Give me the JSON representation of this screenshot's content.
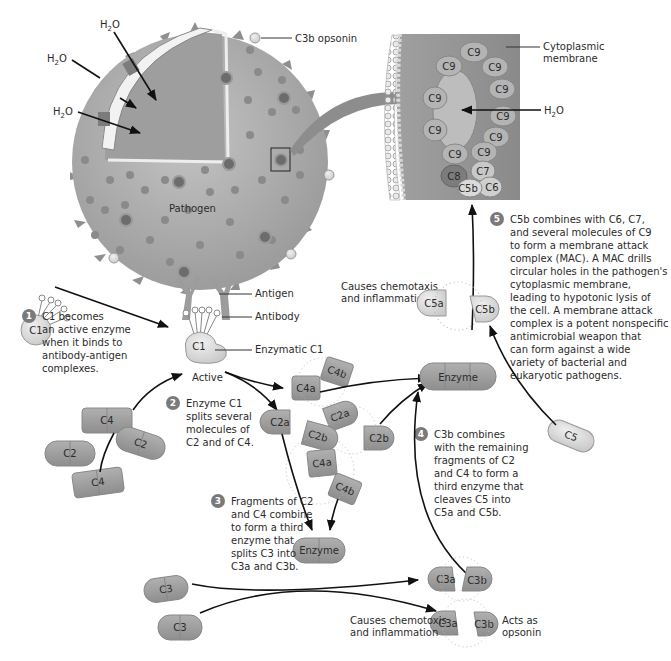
{
  "colors": {
    "pathogen": "#a9a9a9",
    "pathogen_dark": "#8a8a8a",
    "molecule_dark": "#9a9a9a",
    "molecule_light": "#d8d8d8",
    "badge": "#7a7a7a",
    "arrow": "#111111",
    "membrane": "#8f8f8f"
  },
  "pathogen": {
    "label": "Pathogen",
    "water_labels": [
      "H2O",
      "H2O",
      "H2O"
    ],
    "c3b_opsonin": "C3b opsonin",
    "antigen": "Antigen",
    "antibody": "Antibody",
    "enzymatic_c1": "Enzymatic C1",
    "active": "Active"
  },
  "mac_inset": {
    "cytoplasmic_membrane_line1": "Cytoplasmic",
    "cytoplasmic_membrane_line2": "membrane",
    "water": "H2O",
    "molecules": [
      "C9",
      "C9",
      "C9",
      "C9",
      "C9",
      "C9",
      "C9",
      "C9",
      "C9",
      "C9",
      "C8",
      "C7",
      "C6",
      "C5b"
    ]
  },
  "molecules": {
    "c1_inactive": "C1",
    "c1_active": "C1",
    "c4_a": "C4",
    "c4_b": "C4",
    "c2_a": "C2",
    "c2_b": "C2",
    "c4a_1": "C4a",
    "c4b_1": "C4b",
    "c2a_1": "C2a",
    "c2a_2": "C2a",
    "c2b_1": "C2b",
    "c2b_2": "C2b",
    "c4a_2": "C4a",
    "c4b_2": "C4b",
    "enzyme_top": "Enzyme",
    "enzyme_bottom": "Enzyme",
    "c5": "C5",
    "c5a": "C5a",
    "c5b": "C5b",
    "c3_a": "C3",
    "c3_b": "C3",
    "c3a_top": "C3a",
    "c3b_top": "C3b",
    "c3a_bottom": "C3a",
    "c3b_bottom": "C3b"
  },
  "annotations": {
    "c5a_effect_line1": "Causes chemotaxis",
    "c5a_effect_line2": "and inflammation",
    "c3a_effect_line1": "Causes chemotoxis",
    "c3a_effect_line2": "and inflammation",
    "c3b_effect_line1": "Acts as",
    "c3b_effect_line2": "opsonin"
  },
  "steps": [
    {
      "number": "1",
      "lines": [
        "C1 becomes",
        "an active enzyme",
        "when it binds to",
        "antibody-antigen",
        "complexes."
      ]
    },
    {
      "number": "2",
      "lines": [
        "Enzyme C1",
        "splits several",
        "molecules of",
        "C2 and of C4."
      ]
    },
    {
      "number": "3",
      "lines": [
        "Fragments of C2",
        "and C4 combine",
        "to form a third",
        "enzyme that",
        "splits C3 into",
        "C3a and C3b."
      ]
    },
    {
      "number": "4",
      "lines": [
        "C3b combines",
        "with the remaining",
        "fragments of C2",
        "and C4 to form a",
        "third enzyme that",
        "cleaves C5 into",
        "C5a and C5b."
      ]
    },
    {
      "number": "5",
      "lines": [
        "C5b combines with C6, C7,",
        "and several molecules of C9",
        "to form a membrane attack",
        "complex (MAC). A MAC drills",
        "circular holes in the pathogen's",
        "cytoplasmic membrane,",
        "leading to hypotonic lysis of",
        "the cell. A membrane attack",
        "complex is a potent nonspecific",
        "antimicrobial weapon that",
        "can form against a wide",
        "variety of bacterial and",
        "eukaryotic pathogens."
      ]
    }
  ]
}
